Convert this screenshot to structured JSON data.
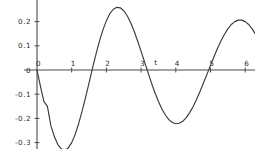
{
  "chart_data": {
    "type": "line",
    "title": "",
    "subtitle": "",
    "xlabel": "t",
    "ylabel": "",
    "xlim": [
      -0.2,
      6.35
    ],
    "ylim": [
      -0.345,
      0.285
    ],
    "grid": false,
    "legend": null,
    "x_ticks": [
      0,
      1,
      2,
      3,
      4,
      5,
      6
    ],
    "x_tick_labels": [
      "0",
      "1",
      "2",
      "3",
      "4",
      "5",
      "6"
    ],
    "y_ticks": [
      0.2,
      0.1,
      0,
      -0.1,
      -0.2,
      -0.3
    ],
    "y_tick_labels": [
      "0.2",
      "0.1",
      "0",
      "-0.1",
      "-0.2",
      "-0.3"
    ],
    "zero_y_tick_label": "0",
    "series": [
      {
        "name": "damped oscillation",
        "color": "#3a3a3a",
        "x": [
          0,
          0.1,
          0.2,
          0.3,
          0.4,
          0.5,
          0.6,
          0.7,
          0.8,
          0.9,
          1.0,
          1.1,
          1.2,
          1.3,
          1.4,
          1.5,
          1.6,
          1.7,
          1.8,
          1.9,
          2.0,
          2.1,
          2.2,
          2.3,
          2.4,
          2.5,
          2.6,
          2.7,
          2.8,
          2.9,
          3.0,
          3.1,
          3.2,
          3.3,
          3.4,
          3.5,
          3.6,
          3.7,
          3.8,
          3.9,
          4.0,
          4.1,
          4.2,
          4.3,
          4.4,
          4.5,
          4.6,
          4.7,
          4.8,
          4.9,
          5.0,
          5.1,
          5.2,
          5.3,
          5.4,
          5.5,
          5.6,
          5.7,
          5.8,
          5.9,
          6.0,
          6.1,
          6.2,
          6.3
        ],
        "y": [
          0,
          -0.068,
          -0.131,
          -0.15,
          -0.23,
          -0.275,
          -0.308,
          -0.326,
          -0.331,
          -0.322,
          -0.3,
          -0.266,
          -0.222,
          -0.17,
          -0.113,
          -0.053,
          0.008,
          0.066,
          0.119,
          0.166,
          0.204,
          0.233,
          0.251,
          0.259,
          0.257,
          0.245,
          0.224,
          0.195,
          0.16,
          0.12,
          0.077,
          0.033,
          -0.011,
          -0.054,
          -0.094,
          -0.13,
          -0.161,
          -0.186,
          -0.205,
          -0.217,
          -0.222,
          -0.22,
          -0.212,
          -0.197,
          -0.176,
          -0.151,
          -0.121,
          -0.088,
          -0.053,
          -0.017,
          0.019,
          0.055,
          0.089,
          0.12,
          0.147,
          0.17,
          0.188,
          0.2,
          0.206,
          0.206,
          0.2,
          0.188,
          0.17,
          0.147
        ]
      }
    ],
    "peaks": [
      {
        "t": 0.8,
        "value": -0.331
      },
      {
        "t": 2.3,
        "value": 0.259
      },
      {
        "t": 3.9,
        "value": -0.222
      },
      {
        "t": 5.35,
        "value": 0.207
      }
    ]
  }
}
